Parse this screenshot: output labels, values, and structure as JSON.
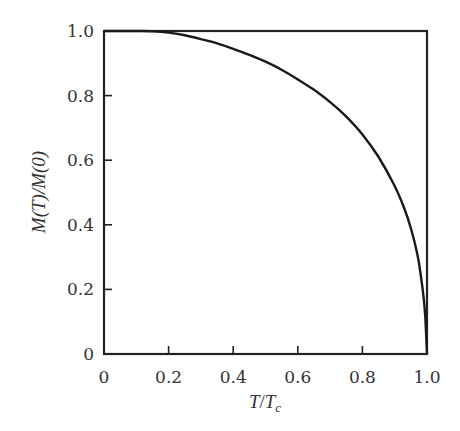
{
  "chart_data": {
    "type": "line",
    "title": "",
    "xlabel": "T/T_c",
    "ylabel": "M(T)/M(0)",
    "xlim": [
      0,
      1.0
    ],
    "ylim": [
      0,
      1.0
    ],
    "grid": false,
    "legend": null,
    "xticks": [
      0,
      0.2,
      0.4,
      0.6,
      0.8,
      1.0
    ],
    "xtick_labels": [
      "0",
      "0.2",
      "0.4",
      "0.6",
      "0.8",
      "1.0"
    ],
    "yticks": [
      0,
      0.2,
      0.4,
      0.6,
      0.8,
      1.0
    ],
    "ytick_labels": [
      "0",
      "0.2",
      "0.4",
      "0.6",
      "0.8",
      "1.0"
    ],
    "series": [
      {
        "name": "M(T)/M(0)",
        "color": "#1a1a1a",
        "x": [
          0,
          0.1,
          0.15,
          0.2,
          0.25,
          0.3,
          0.35,
          0.4,
          0.45,
          0.5,
          0.55,
          0.6,
          0.65,
          0.7,
          0.75,
          0.8,
          0.85,
          0.9,
          0.93,
          0.95,
          0.97,
          0.98,
          0.99,
          0.995,
          1.0
        ],
        "values": [
          1.0,
          1.0,
          0.999,
          0.995,
          0.987,
          0.975,
          0.962,
          0.945,
          0.926,
          0.905,
          0.88,
          0.85,
          0.818,
          0.78,
          0.735,
          0.68,
          0.61,
          0.52,
          0.45,
          0.39,
          0.31,
          0.25,
          0.17,
          0.11,
          0.0
        ]
      }
    ]
  },
  "axes": {
    "x_label": {
      "main": "T",
      "sep": "/",
      "sub_base": "T",
      "sub": "c"
    },
    "y_label": {
      "text": "M(T)/M(0)"
    }
  }
}
